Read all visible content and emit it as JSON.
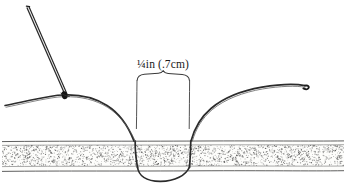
{
  "figure": {
    "background_color": "#ffffff",
    "ink_color": "#1a1a1a",
    "line_color": "#333333"
  },
  "measurement": {
    "label": "¼in (.7cm)",
    "label_x": 163,
    "label_y": 68,
    "bracket": {
      "left_x": 137,
      "right_x": 190,
      "top_y": 78,
      "bottom_y": 128,
      "peak_x": 163,
      "peak_y": 74
    }
  },
  "fabric": {
    "name": "fabric-band",
    "top_edge_y": 141,
    "inner_top_y": 145,
    "inner_bottom_y": 166,
    "bottom_edge_y": 171,
    "left_x": 2,
    "right_x": 344,
    "fill_color": "#fdfdfb",
    "stipple_color": "#4a4a4a",
    "edge_color": "#4d4d4d"
  },
  "needle": {
    "name": "sewing-needle",
    "tip_x": 27,
    "tip_y": 8,
    "eye_x": 64,
    "eye_y": 95,
    "color": "#2b2b2b"
  },
  "knot": {
    "name": "thread-knot",
    "x": 64,
    "y": 95,
    "radius": 2.6,
    "color": "#111111"
  },
  "thread": {
    "name": "thread",
    "color": "#2b2b2b",
    "left_tail_start_x": 5,
    "left_tail_start_y": 105,
    "entry_x": 136,
    "exit_x": 190,
    "loop_bottom_y": 180,
    "right_tail_end_x": 307,
    "right_tail_end_y": 87
  },
  "stipple": {
    "dot_count": 2200,
    "seed": 20240917
  }
}
